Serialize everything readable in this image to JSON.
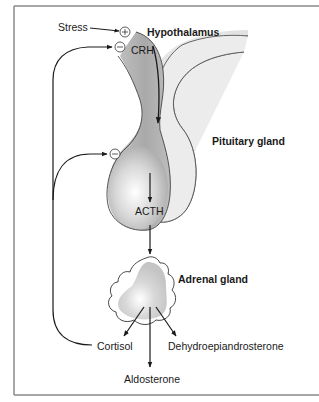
{
  "diagram": {
    "labels": {
      "stress": "Stress",
      "hypothalamus": "Hypothalamus",
      "crh": "CRH",
      "pituitary": "Pituitary gland",
      "acth": "ACTH",
      "adrenal": "Adrenal gland",
      "cortisol": "Cortisol",
      "dhea": "Dehydroepiandrosterone",
      "aldosterone": "Aldosterone"
    },
    "signs": {
      "stimulate": "+",
      "inhibit": "−"
    },
    "nodes": [
      {
        "id": "stress",
        "label": "Stress"
      },
      {
        "id": "hypothalamus",
        "label": "Hypothalamus"
      },
      {
        "id": "pituitary",
        "label": "Pituitary gland"
      },
      {
        "id": "adrenal",
        "label": "Adrenal gland"
      },
      {
        "id": "cortisol",
        "label": "Cortisol"
      },
      {
        "id": "dhea",
        "label": "Dehydroepiandrosterone"
      },
      {
        "id": "aldosterone",
        "label": "Aldosterone"
      }
    ],
    "edges": [
      {
        "from": "stress",
        "to": "hypothalamus",
        "sign": "+"
      },
      {
        "from": "hypothalamus",
        "to": "pituitary",
        "label": "CRH"
      },
      {
        "from": "pituitary",
        "to": "adrenal",
        "label": "ACTH"
      },
      {
        "from": "adrenal",
        "to": "cortisol"
      },
      {
        "from": "adrenal",
        "to": "aldosterone"
      },
      {
        "from": "adrenal",
        "to": "dhea"
      },
      {
        "from": "cortisol",
        "to": "hypothalamus",
        "sign": "−",
        "type": "negative-feedback"
      },
      {
        "from": "cortisol",
        "to": "pituitary",
        "sign": "−",
        "type": "negative-feedback"
      }
    ],
    "colors": {
      "frame": "#8a8a8a",
      "line": "#1a1a1a",
      "dark_lobe": "#b9b9b9",
      "light_lobe": "#ececec",
      "adrenal_fill": "#d4d4d4"
    }
  }
}
